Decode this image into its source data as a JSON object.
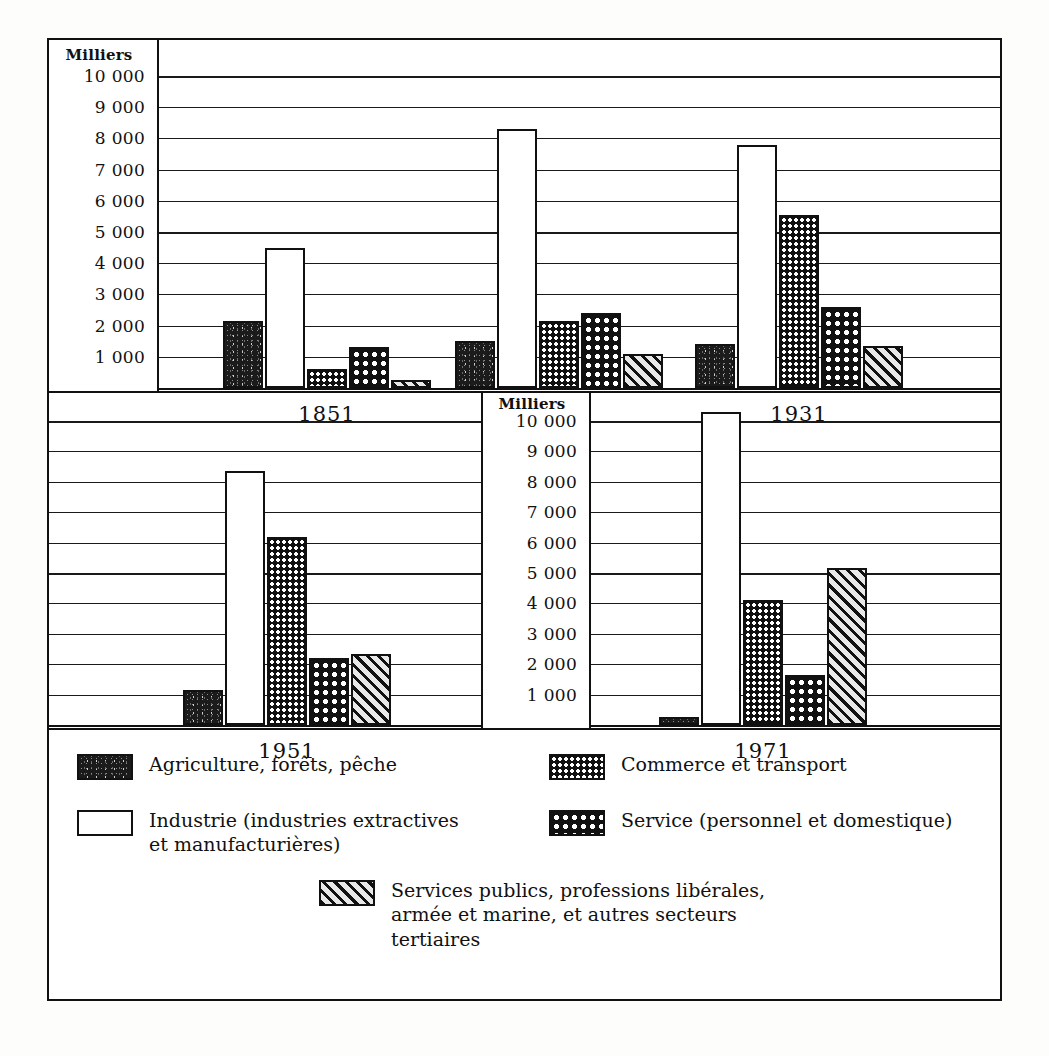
{
  "axis": {
    "title": "Milliers",
    "ticks": [
      "10 000",
      "9 000",
      "8 000",
      "7 000",
      "6 000",
      "5 000",
      "4 000",
      "3 000",
      "2 000",
      "1 000"
    ]
  },
  "panels": [
    {
      "name": "panel-top",
      "years": [
        "1851",
        "1901",
        "1931"
      ]
    },
    {
      "name": "panel-bottom",
      "years": [
        "1951",
        "1971"
      ]
    }
  ],
  "legend": {
    "items": [
      {
        "key": "agriculture",
        "pattern": "p-agri",
        "label": "Agriculture, forêts, pêche"
      },
      {
        "key": "industrie",
        "pattern": "p-indus",
        "label": "Industrie (industries extractives\net manufacturières)"
      },
      {
        "key": "commerce",
        "pattern": "p-comm",
        "label": "Commerce et transport"
      },
      {
        "key": "service",
        "pattern": "p-serv",
        "label": "Service (personnel et domestique)"
      },
      {
        "key": "services-publics",
        "pattern": "p-pub",
        "label": "Services publics, professions libérales,\narmée et marine, et autres secteurs\ntertiaires"
      }
    ]
  },
  "chart_data": {
    "type": "bar",
    "title": "",
    "xlabel": "",
    "ylabel": "Milliers",
    "ylim": [
      0,
      10000
    ],
    "ytick_step": 1000,
    "grid": true,
    "legend_position": "bottom",
    "categories": [
      "1851",
      "1901",
      "1931",
      "1951",
      "1971"
    ],
    "series": [
      {
        "name": "Agriculture, forêts, pêche",
        "pattern": "p-agri",
        "values": [
          2150,
          1500,
          1400,
          1150,
          250
        ]
      },
      {
        "name": "Industrie (industries extractives et manufacturières)",
        "pattern": "p-indus",
        "values": [
          4500,
          8300,
          7800,
          8350,
          10300
        ]
      },
      {
        "name": "Commerce et transport",
        "pattern": "p-comm",
        "values": [
          600,
          2150,
          5550,
          6200,
          4100
        ]
      },
      {
        "name": "Service (personnel et domestique)",
        "pattern": "p-serv",
        "values": [
          1320,
          2400,
          2600,
          2200,
          1650
        ]
      },
      {
        "name": "Services publics, professions libérales, armée et marine, et autres secteurs tertiaires",
        "pattern": "p-pub",
        "values": [
          250,
          1100,
          1350,
          2350,
          5150
        ]
      }
    ]
  }
}
